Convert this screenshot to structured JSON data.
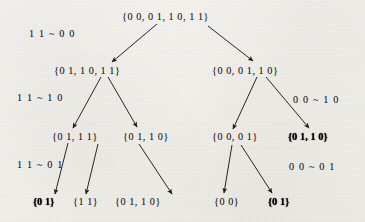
{
  "figure": {
    "type": "binary-decision-tree",
    "tilde": "~"
  },
  "split_labels": [
    {
      "id": "split-11-00",
      "text": "1 1 ~ 0 0",
      "side": "left",
      "level": 1
    },
    {
      "id": "split-11-10",
      "text": "1 1 ~ 1 0",
      "side": "left",
      "level": 2
    },
    {
      "id": "split-11-01",
      "text": "1 1 ~ 0 1",
      "side": "left",
      "level": 3
    },
    {
      "id": "split-00-10",
      "text": "0 0 ~ 1 0",
      "side": "right",
      "level": 2
    },
    {
      "id": "split-00-01",
      "text": "0 0 ~ 0 1",
      "side": "right",
      "level": 3
    }
  ],
  "nodes": [
    {
      "id": "root",
      "level": 0,
      "text": "{0 0,  0 1,  1 0,  1 1}",
      "elements": [
        "00",
        "01",
        "10",
        "11"
      ],
      "degraded": false
    },
    {
      "id": "n-l",
      "level": 1,
      "text": "{0 1,  1 0,  1 1}",
      "elements": [
        "01",
        "10",
        "11"
      ],
      "degraded": false
    },
    {
      "id": "n-r",
      "level": 1,
      "text": "{0 0,  0 1,  1 0}",
      "elements": [
        "00",
        "01",
        "10"
      ],
      "degraded": false
    },
    {
      "id": "n-ll",
      "level": 2,
      "text": "{0 1,  1 1}",
      "elements": [
        "01",
        "11"
      ],
      "degraded": false
    },
    {
      "id": "n-lr",
      "level": 2,
      "text": "{0 1,  1 0}",
      "elements": [
        "01",
        "10"
      ],
      "degraded": false
    },
    {
      "id": "n-rl",
      "level": 2,
      "text": "{0 0,  0 1}",
      "elements": [
        "00",
        "01"
      ],
      "degraded": false
    },
    {
      "id": "n-rr",
      "level": 2,
      "text": "{0 1,  1 0}",
      "elements": [
        "01",
        "10"
      ],
      "degraded": true
    },
    {
      "id": "n-lll",
      "level": 3,
      "text": "{0 1}",
      "elements": [
        "01"
      ],
      "degraded": true
    },
    {
      "id": "n-llr",
      "level": 3,
      "text": "{1 1}",
      "elements": [
        "11"
      ],
      "degraded": false
    },
    {
      "id": "n-lrr",
      "level": 3,
      "text": "{0 1,  1 0}",
      "elements": [
        "01",
        "10"
      ],
      "degraded": false
    },
    {
      "id": "n-rll",
      "level": 3,
      "text": "{0 0}",
      "elements": [
        "00"
      ],
      "degraded": false
    },
    {
      "id": "n-rlr",
      "level": 3,
      "text": "{0 1}",
      "elements": [
        "01"
      ],
      "degraded": true
    }
  ],
  "edges": [
    {
      "from": "root",
      "to": "n-l"
    },
    {
      "from": "root",
      "to": "n-r"
    },
    {
      "from": "n-l",
      "to": "n-ll"
    },
    {
      "from": "n-l",
      "to": "n-lr"
    },
    {
      "from": "n-r",
      "to": "n-rl"
    },
    {
      "from": "n-r",
      "to": "n-rr"
    },
    {
      "from": "n-ll",
      "to": "n-lll"
    },
    {
      "from": "n-ll",
      "to": "n-llr"
    },
    {
      "from": "n-lr",
      "to": "n-lrr"
    },
    {
      "from": "n-rl",
      "to": "n-rll"
    },
    {
      "from": "n-rl",
      "to": "n-rlr"
    }
  ],
  "colors": {
    "ink": "#1d1b19",
    "paper": "#f4f2ee"
  }
}
